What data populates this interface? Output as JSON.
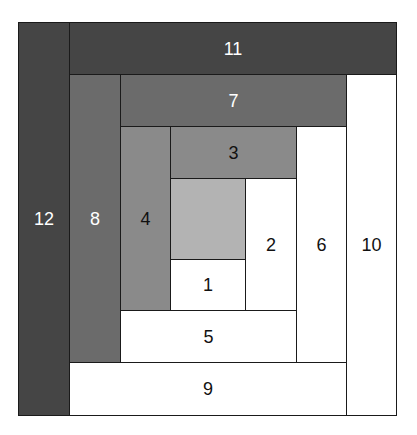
{
  "diagram": {
    "outer": {
      "x": 18,
      "y": 22,
      "width": 379,
      "height": 394
    },
    "colors": {
      "center": "#b3b3b3",
      "ring1_dark": "#8a8a8a",
      "ring2_dark": "#6b6b6b",
      "ring3_dark": "#454545",
      "light": "#ffffff",
      "border": "#1a1a1a",
      "label_dark_bg": "#ffffff",
      "label_light_bg": "#111111"
    },
    "blocks": [
      {
        "id": "center",
        "label": "",
        "x": 170,
        "y": 178,
        "w": 76,
        "h": 82,
        "fill": "#b3b3b3",
        "text": "#111111"
      },
      {
        "id": "1",
        "label": "1",
        "x": 170,
        "y": 259,
        "w": 76,
        "h": 52,
        "fill": "#ffffff",
        "text": "#111111"
      },
      {
        "id": "2",
        "label": "2",
        "x": 245,
        "y": 178,
        "w": 52,
        "h": 133,
        "fill": "#ffffff",
        "text": "#111111"
      },
      {
        "id": "3",
        "label": "3",
        "x": 170,
        "y": 126,
        "w": 127,
        "h": 53,
        "fill": "#8a8a8a",
        "text": "#111111"
      },
      {
        "id": "4",
        "label": "4",
        "x": 120,
        "y": 126,
        "w": 51,
        "h": 185,
        "fill": "#8a8a8a",
        "text": "#111111"
      },
      {
        "id": "5",
        "label": "5",
        "x": 120,
        "y": 310,
        "w": 177,
        "h": 53,
        "fill": "#ffffff",
        "text": "#111111"
      },
      {
        "id": "6",
        "label": "6",
        "x": 296,
        "y": 126,
        "w": 51,
        "h": 237,
        "fill": "#ffffff",
        "text": "#111111"
      },
      {
        "id": "7",
        "label": "7",
        "x": 120,
        "y": 74,
        "w": 227,
        "h": 53,
        "fill": "#6b6b6b",
        "text": "#ffffff"
      },
      {
        "id": "8",
        "label": "8",
        "x": 69,
        "y": 74,
        "w": 52,
        "h": 289,
        "fill": "#6b6b6b",
        "text": "#ffffff"
      },
      {
        "id": "9",
        "label": "9",
        "x": 69,
        "y": 362,
        "w": 278,
        "h": 54,
        "fill": "#ffffff",
        "text": "#111111"
      },
      {
        "id": "10",
        "label": "10",
        "x": 346,
        "y": 74,
        "w": 51,
        "h": 342,
        "fill": "#ffffff",
        "text": "#111111"
      },
      {
        "id": "11",
        "label": "11",
        "x": 69,
        "y": 22,
        "w": 328,
        "h": 53,
        "fill": "#454545",
        "text": "#ffffff"
      },
      {
        "id": "12",
        "label": "12",
        "x": 18,
        "y": 22,
        "w": 52,
        "h": 394,
        "fill": "#454545",
        "text": "#ffffff"
      }
    ]
  }
}
